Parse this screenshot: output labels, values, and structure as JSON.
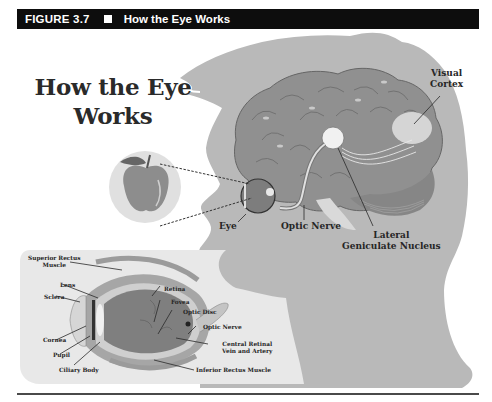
{
  "header": {
    "figure_number": "FIGURE 3.7",
    "separator_icon": "square-bullet",
    "caption": "How the Eye Works"
  },
  "diagram": {
    "title_line1": "How the Eye",
    "title_line2": "Works",
    "object_icon": "apple",
    "head_labels": {
      "visual_cortex_1": "Visual",
      "visual_cortex_2": "Cortex",
      "eye": "Eye",
      "optic_nerve": "Optic Nerve",
      "lgn_1": "Lateral",
      "lgn_2": "Geniculate Nucleus"
    },
    "eye_inset_labels": {
      "superior_rectus_1": "Superior Rectus",
      "superior_rectus_2": "Muscle",
      "lens": "Lens",
      "sclera": "Sclera",
      "cornea": "Cornea",
      "pupil": "Pupil",
      "ciliary_body": "Ciliary Body",
      "retina": "Retina",
      "fovea": "Fovea",
      "optic_disc": "Optic Disc",
      "optic_nerve": "Optic Nerve",
      "central_retinal_1": "Central Retinal",
      "central_retinal_2": "Vein and Artery",
      "inferior_rectus": "Inferior Rectus Muscle"
    }
  },
  "colors": {
    "header_bg": "#0d0d0d",
    "head_gray": "#b9b9b9",
    "brain_gray": "#8f8f8f",
    "inset_bg": "#e8e8e8",
    "text": "#262626"
  }
}
